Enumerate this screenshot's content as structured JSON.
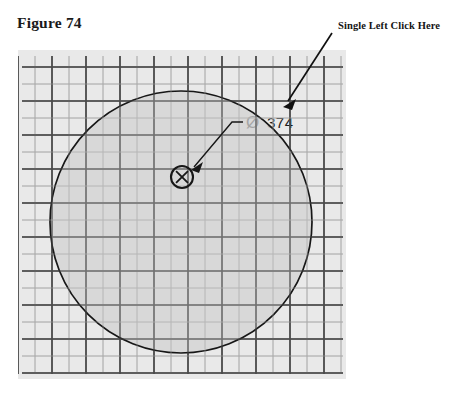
{
  "figure": {
    "caption": "Figure 74"
  },
  "annotation": {
    "instruction_text": "Single Left Click Here",
    "arrow_icon": "arrow-down-left-icon",
    "arrow_start": [
      332,
      33
    ],
    "arrow_end": [
      284,
      106
    ]
  },
  "drawing": {
    "background_color": "#e9e9e9",
    "canvas": {
      "x": 18,
      "y": 50,
      "width": 328,
      "height": 329
    },
    "grid": {
      "major_color": "#4a4a4a",
      "minor_color": "#a8a8a8",
      "major_spacing": 34,
      "minor_spacing": 17,
      "major_width": 1.6,
      "minor_width": 0.8
    },
    "circle": {
      "name": "sketch-circle",
      "center": [
        181,
        222
      ],
      "radius": 131,
      "stroke_color": "#171717",
      "fill_color": "#d2d2d2"
    },
    "center_marker": {
      "name": "center-point-marker",
      "glyph": "x-in-circle-icon",
      "center": [
        182,
        177
      ],
      "radius": 11
    },
    "dimension": {
      "name": "diameter-dimension",
      "symbol": "Ø",
      "value": "374",
      "leader_from": [
        243,
        122
      ],
      "leader_elbow": [
        232,
        122
      ],
      "leader_to": [
        194,
        167
      ]
    }
  }
}
